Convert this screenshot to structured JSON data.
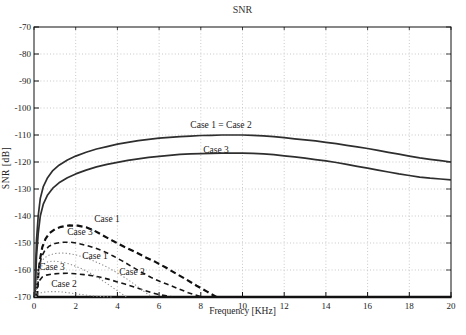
{
  "figure": {
    "width": 466,
    "height": 335
  },
  "chart_data": {
    "type": "line",
    "title": "SNR",
    "xlabel": "Frequency [KHz]",
    "ylabel": "SNR [dB]",
    "xlim": [
      0,
      20
    ],
    "ylim": [
      -170,
      -70
    ],
    "xticks": [
      0,
      2,
      4,
      6,
      8,
      10,
      12,
      14,
      16,
      18,
      20
    ],
    "yticks": [
      -170,
      -160,
      -150,
      -140,
      -130,
      -120,
      -110,
      -100,
      -90,
      -80,
      -70
    ],
    "grid": true,
    "grid_color": "#c8c8c8",
    "axis_color": "#111111",
    "background": "#ffffff",
    "series": [
      {
        "name": "Case 1 = Case 2 (solid)",
        "style": "solid",
        "color": "#2e2e2e",
        "width": 1.7,
        "dash": "",
        "points": [
          [
            0.05,
            -170
          ],
          [
            0.08,
            -158
          ],
          [
            0.12,
            -149
          ],
          [
            0.2,
            -140
          ],
          [
            0.3,
            -133.5
          ],
          [
            0.45,
            -129
          ],
          [
            0.65,
            -125.8
          ],
          [
            0.9,
            -123.2
          ],
          [
            1.2,
            -121.2
          ],
          [
            1.6,
            -119.3
          ],
          [
            2,
            -117.8
          ],
          [
            2.5,
            -116.4
          ],
          [
            3,
            -115.2
          ],
          [
            3.5,
            -114.3
          ],
          [
            4,
            -113.4
          ],
          [
            4.5,
            -112.7
          ],
          [
            5,
            -112.1
          ],
          [
            5.5,
            -111.6
          ],
          [
            6,
            -111.2
          ],
          [
            6.5,
            -110.9
          ],
          [
            7,
            -110.6
          ],
          [
            7.5,
            -110.4
          ],
          [
            8,
            -110.2
          ],
          [
            8.5,
            -110.1
          ],
          [
            9,
            -110
          ],
          [
            10,
            -110
          ],
          [
            10.5,
            -110.1
          ],
          [
            11,
            -110.3
          ],
          [
            11.5,
            -110.6
          ],
          [
            12,
            -111
          ],
          [
            12.5,
            -111.4
          ],
          [
            13,
            -111.8
          ],
          [
            13.5,
            -112.2
          ],
          [
            14,
            -112.7
          ],
          [
            14.5,
            -113.2
          ],
          [
            15,
            -113.8
          ],
          [
            15.5,
            -114.4
          ],
          [
            16,
            -115
          ],
          [
            16.5,
            -115.7
          ],
          [
            17,
            -116.4
          ],
          [
            17.5,
            -117.1
          ],
          [
            18,
            -117.8
          ],
          [
            18.5,
            -118.5
          ],
          [
            19,
            -119
          ],
          [
            19.5,
            -119.5
          ],
          [
            20,
            -120
          ]
        ]
      },
      {
        "name": "Case 3 (solid)",
        "style": "solid",
        "color": "#2e2e2e",
        "width": 1.7,
        "dash": "",
        "points": [
          [
            0.05,
            -170
          ],
          [
            0.08,
            -163
          ],
          [
            0.12,
            -155
          ],
          [
            0.2,
            -146.5
          ],
          [
            0.3,
            -140
          ],
          [
            0.45,
            -135.5
          ],
          [
            0.65,
            -132.2
          ],
          [
            0.9,
            -129.7
          ],
          [
            1.2,
            -127.7
          ],
          [
            1.6,
            -125.8
          ],
          [
            2,
            -124.4
          ],
          [
            2.5,
            -123
          ],
          [
            3,
            -121.8
          ],
          [
            3.5,
            -120.9
          ],
          [
            4,
            -120.1
          ],
          [
            4.5,
            -119.4
          ],
          [
            5,
            -118.8
          ],
          [
            5.5,
            -118.3
          ],
          [
            6,
            -117.9
          ],
          [
            6.5,
            -117.5
          ],
          [
            7,
            -117.2
          ],
          [
            7.5,
            -117
          ],
          [
            8,
            -116.9
          ],
          [
            8.5,
            -116.8
          ],
          [
            9,
            -116.7
          ],
          [
            10,
            -116.7
          ],
          [
            10.5,
            -116.8
          ],
          [
            11,
            -117
          ],
          [
            11.5,
            -117.3
          ],
          [
            12,
            -117.7
          ],
          [
            12.5,
            -118.1
          ],
          [
            13,
            -118.6
          ],
          [
            13.5,
            -119.1
          ],
          [
            14,
            -119.6
          ],
          [
            14.5,
            -120.2
          ],
          [
            15,
            -120.9
          ],
          [
            15.5,
            -121.6
          ],
          [
            16,
            -122.3
          ],
          [
            16.5,
            -123
          ],
          [
            17,
            -123.7
          ],
          [
            17.5,
            -124.4
          ],
          [
            18,
            -125
          ],
          [
            18.5,
            -125.6
          ],
          [
            19,
            -126
          ],
          [
            19.5,
            -126.3
          ],
          [
            20,
            -126.6
          ]
        ]
      },
      {
        "name": "Case 1 (dashed)",
        "style": "dashed",
        "color": "#101010",
        "width": 2.2,
        "dash": "6 3.5",
        "points": [
          [
            0.15,
            -170
          ],
          [
            0.2,
            -162
          ],
          [
            0.28,
            -156.5
          ],
          [
            0.4,
            -151.5
          ],
          [
            0.55,
            -148.5
          ],
          [
            0.75,
            -146.3
          ],
          [
            1,
            -144.9
          ],
          [
            1.3,
            -144
          ],
          [
            1.7,
            -143.5
          ],
          [
            2.1,
            -143.6
          ],
          [
            2.5,
            -144.2
          ],
          [
            2.9,
            -145.5
          ],
          [
            3.3,
            -147.2
          ],
          [
            3.8,
            -149.3
          ],
          [
            4.3,
            -151.3
          ],
          [
            4.8,
            -153.1
          ],
          [
            5.3,
            -155.1
          ],
          [
            5.8,
            -156.9
          ],
          [
            6.3,
            -159
          ],
          [
            6.8,
            -161.3
          ],
          [
            7.3,
            -163.5
          ],
          [
            7.8,
            -165.8
          ],
          [
            8.3,
            -168
          ],
          [
            8.75,
            -170
          ]
        ]
      },
      {
        "name": "Case 3 (dashed)",
        "style": "dashed",
        "color": "#161616",
        "width": 1.6,
        "dash": "5 3.5",
        "points": [
          [
            0.12,
            -170
          ],
          [
            0.17,
            -163
          ],
          [
            0.25,
            -158.5
          ],
          [
            0.37,
            -155
          ],
          [
            0.52,
            -152.8
          ],
          [
            0.72,
            -151.2
          ],
          [
            1,
            -150.2
          ],
          [
            1.35,
            -149.7
          ],
          [
            1.75,
            -149.7
          ],
          [
            2.15,
            -150.2
          ],
          [
            2.55,
            -151
          ],
          [
            2.95,
            -151.9
          ],
          [
            3.35,
            -153.1
          ],
          [
            3.8,
            -154.8
          ],
          [
            4.25,
            -156.7
          ],
          [
            4.7,
            -158.8
          ],
          [
            5.15,
            -160.8
          ],
          [
            5.6,
            -162.7
          ],
          [
            6,
            -164.1
          ],
          [
            6.4,
            -165.3
          ],
          [
            6.9,
            -166.9
          ],
          [
            7.4,
            -168.4
          ],
          [
            8.05,
            -170
          ]
        ]
      },
      {
        "name": "Case 2 (dashed)",
        "style": "dashed",
        "color": "#161616",
        "width": 1.6,
        "dash": "5 3.5",
        "points": [
          [
            0.12,
            -170
          ],
          [
            0.16,
            -166.5
          ],
          [
            0.25,
            -164
          ],
          [
            0.4,
            -162.6
          ],
          [
            0.6,
            -161.9
          ],
          [
            0.85,
            -161.5
          ],
          [
            1.2,
            -161.3
          ],
          [
            1.6,
            -161.2
          ],
          [
            2,
            -161.4
          ],
          [
            2.4,
            -161.7
          ],
          [
            2.8,
            -162.1
          ],
          [
            3.2,
            -162.7
          ],
          [
            3.6,
            -163.5
          ],
          [
            4,
            -164.4
          ],
          [
            4.4,
            -165.3
          ],
          [
            4.8,
            -166.3
          ],
          [
            5.2,
            -167.3
          ],
          [
            5.6,
            -168.3
          ],
          [
            6,
            -169.1
          ],
          [
            6.35,
            -169.6
          ],
          [
            6.65,
            -170
          ]
        ]
      },
      {
        "name": "Case 1 (dotted)",
        "style": "dotted",
        "color": "#8f8f8f",
        "width": 1.1,
        "dash": "1.3 2.2",
        "points": [
          [
            0.1,
            -170
          ],
          [
            0.15,
            -163.5
          ],
          [
            0.22,
            -159.8
          ],
          [
            0.33,
            -157.2
          ],
          [
            0.5,
            -155.5
          ],
          [
            0.72,
            -154.5
          ],
          [
            1,
            -153.9
          ],
          [
            1.3,
            -153.7
          ],
          [
            1.65,
            -153.9
          ],
          [
            2,
            -154.4
          ],
          [
            2.4,
            -155.3
          ],
          [
            2.8,
            -156.4
          ],
          [
            3.2,
            -157.8
          ],
          [
            3.6,
            -159.3
          ],
          [
            4,
            -161.1
          ],
          [
            4.4,
            -163
          ],
          [
            4.8,
            -165.2
          ],
          [
            5.2,
            -167.5
          ],
          [
            5.65,
            -170
          ]
        ]
      },
      {
        "name": "Case 3 (dotted)",
        "style": "dotted",
        "color": "#8f8f8f",
        "width": 1.1,
        "dash": "1.3 2.2",
        "points": [
          [
            0.08,
            -170
          ],
          [
            0.13,
            -164.5
          ],
          [
            0.2,
            -161.3
          ],
          [
            0.3,
            -159.2
          ],
          [
            0.45,
            -157.8
          ],
          [
            0.65,
            -157
          ],
          [
            0.9,
            -156.7
          ],
          [
            1.2,
            -156.9
          ],
          [
            1.55,
            -157.4
          ],
          [
            1.9,
            -158.3
          ],
          [
            2.3,
            -159.6
          ],
          [
            2.7,
            -161.2
          ],
          [
            3.1,
            -163
          ],
          [
            3.5,
            -165
          ],
          [
            3.9,
            -167.2
          ],
          [
            4.3,
            -169.3
          ],
          [
            4.45,
            -170
          ]
        ]
      },
      {
        "name": "Case 2 (dotted)",
        "style": "dotted",
        "color": "#8f8f8f",
        "width": 1.1,
        "dash": "1.3 2.2",
        "points": [
          [
            0.07,
            -170
          ],
          [
            0.1,
            -169.4
          ],
          [
            0.2,
            -168.8
          ],
          [
            0.35,
            -168.4
          ],
          [
            0.55,
            -168.1
          ],
          [
            0.8,
            -168
          ],
          [
            1.1,
            -168
          ],
          [
            1.4,
            -168.2
          ],
          [
            1.7,
            -168.5
          ],
          [
            2,
            -168.8
          ],
          [
            2.3,
            -169.1
          ],
          [
            2.6,
            -169.4
          ],
          [
            2.95,
            -169.7
          ],
          [
            3.4,
            -169.9
          ],
          [
            3.8,
            -170
          ]
        ]
      }
    ],
    "annotations": [
      {
        "text": "Case 1 = Case 2",
        "x_px": 221,
        "y_px": 125
      },
      {
        "text": "Case 3",
        "x_px": 216,
        "y_px": 150
      },
      {
        "text": "Case 1",
        "x_px": 107,
        "y_px": 219
      },
      {
        "text": "Case 3",
        "x_px": 80,
        "y_px": 232
      },
      {
        "text": "Case 1",
        "x_px": 95,
        "y_px": 256
      },
      {
        "text": "Case 3",
        "x_px": 52,
        "y_px": 267
      },
      {
        "text": "Case 2",
        "x_px": 132,
        "y_px": 272
      },
      {
        "text": "Case 2",
        "x_px": 64,
        "y_px": 284
      }
    ]
  }
}
